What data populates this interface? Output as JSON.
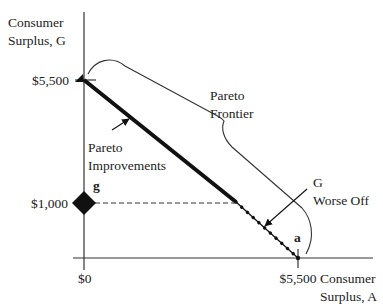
{
  "diagram": {
    "type": "pareto-frontier",
    "y_axis": {
      "label_line1": "Consumer",
      "label_line2": "Surplus, G"
    },
    "x_axis": {
      "label_line1": "Consumer",
      "label_line2": "Surplus, A"
    },
    "y_ticks": {
      "top": "$5,500",
      "mid": "$1,000"
    },
    "x_ticks": {
      "origin": "$0",
      "right": "$5,500"
    },
    "points": {
      "g": "g",
      "a": "a"
    },
    "annotations": {
      "frontier_line1": "Pareto",
      "frontier_line2": "Frontier",
      "improvements_line1": "Pareto",
      "improvements_line2": "Improvements",
      "worse_line1": "G",
      "worse_line2": "Worse Off"
    },
    "colors": {
      "ink": "#111111",
      "text": "#222222",
      "background": "#ffffff"
    }
  }
}
